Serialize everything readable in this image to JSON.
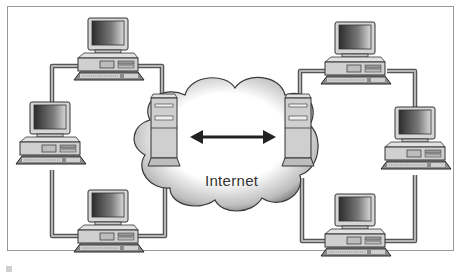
{
  "diagram": {
    "type": "network-diagram",
    "cloud_label": "Internet",
    "connection": "bidirectional-arrow",
    "left_network": {
      "server": "server-tower-left",
      "workstations": [
        "pc-top-left",
        "pc-middle-left",
        "pc-bottom-left"
      ]
    },
    "right_network": {
      "server": "server-tower-right",
      "workstations": [
        "pc-top-right",
        "pc-middle-right",
        "pc-bottom-right"
      ]
    },
    "colors": {
      "frame": "#9a9a9a",
      "cable": "#6e6e6e",
      "cable_fill": "#b9b9b9",
      "device_body": "#d4d4d4",
      "screen_dark": "#3a3a3a",
      "arrow": "#222222"
    }
  }
}
